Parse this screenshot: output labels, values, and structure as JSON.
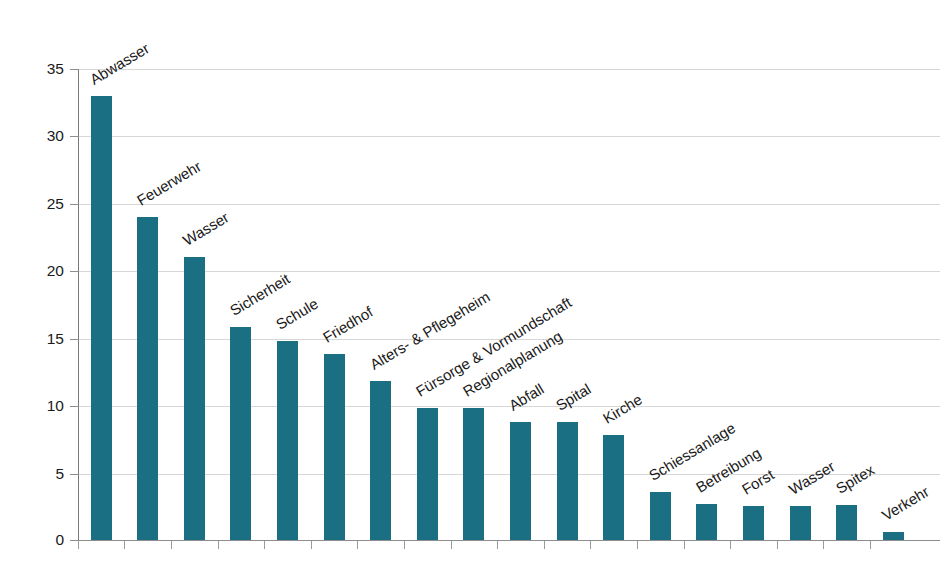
{
  "chart_data": {
    "type": "bar",
    "title": "",
    "subtitle": "",
    "xlabel": "",
    "ylabel": "",
    "ylim": [
      0,
      35
    ],
    "yticks": [
      0,
      5,
      10,
      15,
      20,
      25,
      30,
      35
    ],
    "ytick_labels": [
      "0",
      "5",
      "10",
      "15",
      "20",
      "25",
      "30",
      "35"
    ],
    "grid": true,
    "legend": false,
    "legend_position": "none",
    "bar_color": "#1b6f82",
    "gridline_color": "#d7d7d7",
    "axis_color": "#8d8d8d",
    "label_rotation_deg": -31,
    "categories": [
      "Abwasser",
      "Feuerwehr",
      "Wasser",
      "Sicherheit",
      "Schule",
      "Friedhof",
      "Alters- & Pflegeheim",
      "Fürsorge & Vormundschaft",
      "Regionalplanung",
      "Abfall",
      "Spital",
      "Kirche",
      "Schiessanlage",
      "Betreibung",
      "Forst",
      "Wasser",
      "Spitex",
      "Verkehr"
    ],
    "values": [
      33,
      24,
      21,
      15.8,
      14.8,
      13.8,
      11.8,
      9.8,
      9.8,
      8.8,
      8.8,
      7.8,
      3.6,
      2.7,
      2.5,
      2.5,
      2.6,
      0.6
    ]
  }
}
